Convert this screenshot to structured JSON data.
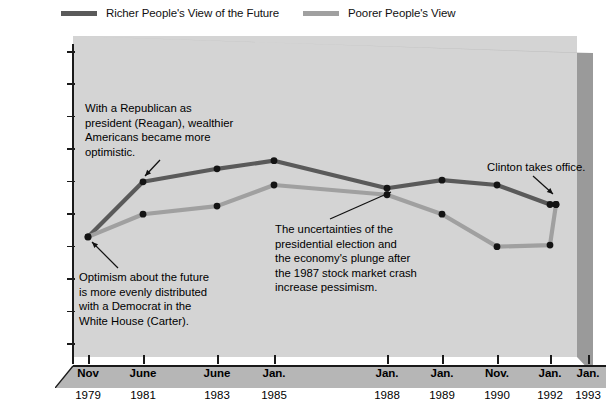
{
  "legend": {
    "items": [
      {
        "label": "Richer People's View of the Future",
        "color": "#5a5a5a",
        "key": "richer"
      },
      {
        "label": "Poorer People's View",
        "color": "#a0a0a0",
        "key": "poorer"
      }
    ]
  },
  "axes": {
    "y_top_label": "Best = 10",
    "y_bottom_label": "Worst = 1",
    "y_ticks": [
      "Best = 10",
      "9",
      "8",
      "7",
      "6",
      "5",
      "4",
      "3",
      "2",
      "Worst = 1"
    ]
  },
  "annotations": {
    "reagan": "With a Republican as\npresident (Reagan), wealthier\nAmericans became more\noptimistic.",
    "carter": "Optimism about the future\nis more evenly distributed\nwith a Democrat in the\nWhite House (Carter).",
    "election": "The uncertainties of the\npresidential election and\nthe economy's plunge after\nthe 1987 stock market crash\nincrease pessimism.",
    "clinton": "Clinton takes office."
  },
  "chart_data": {
    "type": "line",
    "title": "",
    "xlabel": "",
    "ylabel": "",
    "ylim": [
      1,
      10
    ],
    "grid": false,
    "legend_position": "top",
    "categories": [
      "Nov 1979",
      "June 1981",
      "June 1983",
      "Jan. 1985",
      "Jan. 1988",
      "Jan. 1989",
      "Nov. 1990",
      "Jan. 1992",
      "Jan. 1993"
    ],
    "x_month_labels": [
      "Nov",
      "June",
      "June",
      "Jan.",
      "Jan.",
      "Jan.",
      "Nov.",
      "Jan.",
      "Jan."
    ],
    "x_year_labels": [
      "1979",
      "1981",
      "1983",
      "1985",
      "1988",
      "1989",
      "1990",
      "1992",
      "1993"
    ],
    "series": [
      {
        "name": "Richer People's View of the Future",
        "color": "#5a5a5a",
        "values": [
          4.3,
          6.0,
          6.4,
          6.65,
          5.8,
          6.05,
          5.9,
          5.3,
          5.3
        ]
      },
      {
        "name": "Poorer People's View",
        "color": "#a0a0a0",
        "values": [
          4.3,
          5.0,
          5.25,
          5.9,
          5.6,
          5.0,
          4.0,
          4.05,
          5.3
        ]
      }
    ]
  }
}
